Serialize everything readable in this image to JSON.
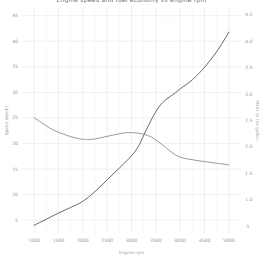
{
  "chart_data": {
    "type": "line",
    "title": "Engine speed and fuel economy vs engine rpm",
    "xlabel": "Engine rpm",
    "ylabel": "Speed (km/h)",
    "ylabel_right": "Miles to the gallon",
    "xlim": [
      750,
      5250
    ],
    "ylim": [
      2.5,
      46.5
    ],
    "ylim_right": [
      0.37,
      4.63
    ],
    "grid": true,
    "legend": "none",
    "xticks": [
      1000,
      1500,
      2000,
      2500,
      3000,
      3500,
      4000,
      4500,
      5000
    ],
    "xtick_labels": [
      "1000",
      "1500",
      "2000",
      "2500",
      "3000",
      "3500",
      "4000",
      "4500",
      "5000"
    ],
    "yticks": [
      5,
      10,
      15,
      20,
      25,
      30,
      35,
      40,
      45
    ],
    "ytick_labels": [
      "5",
      "10",
      "15",
      "20",
      "25",
      "30",
      "35",
      "40",
      "45"
    ],
    "yticks_right": [
      0.5,
      1.0,
      1.5,
      2.0,
      2.5,
      3.0,
      3.5,
      4.0,
      4.5
    ],
    "ytick_labels_right": [
      ".5",
      "1.0",
      "1.5",
      "2.0",
      "2.5",
      "3.0",
      "3.5",
      "4.0",
      "4.5"
    ],
    "series": [
      {
        "name": "Speed (km/h)",
        "axis": "left",
        "color": "#555560",
        "x": [
          1000,
          1250,
          1500,
          1750,
          2000,
          2250,
          2500,
          2750,
          3000,
          3150,
          3300,
          3450,
          3600,
          3750,
          3900,
          4000,
          4150,
          4300,
          4500,
          4700,
          4850,
          5000
        ],
        "values": [
          4.0,
          5.2,
          6.4,
          7.5,
          8.7,
          10.6,
          12.9,
          15.2,
          17.6,
          19.6,
          22.6,
          25.4,
          27.6,
          28.9,
          29.9,
          30.7,
          31.7,
          32.9,
          34.9,
          37.3,
          39.4,
          41.8
        ]
      },
      {
        "name": "Miles to the gallon",
        "axis": "right",
        "color": "#8d8d95",
        "x": [
          1000,
          1150,
          1350,
          1550,
          1800,
          2000,
          2100,
          2250,
          2450,
          2650,
          2850,
          2950,
          3100,
          3250,
          3400,
          3550,
          3700,
          3850,
          4000,
          4200,
          4400,
          4600,
          4800,
          5000
        ],
        "values": [
          2.55,
          2.46,
          2.34,
          2.26,
          2.18,
          2.145,
          2.14,
          2.15,
          2.19,
          2.23,
          2.265,
          2.27,
          2.265,
          2.24,
          2.19,
          2.1,
          1.99,
          1.88,
          1.805,
          1.765,
          1.735,
          1.71,
          1.685,
          1.66
        ]
      }
    ]
  }
}
